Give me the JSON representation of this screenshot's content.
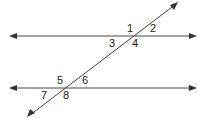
{
  "diagram": {
    "type": "parallel-lines-cut-by-transversal",
    "lines": [
      {
        "name": "top-parallel-line",
        "y": 36
      },
      {
        "name": "bottom-parallel-line",
        "y": 88
      }
    ],
    "transversal": {
      "from": [
        28,
        117
      ],
      "to": [
        178,
        3
      ]
    },
    "angle_labels": {
      "a1": "1",
      "a2": "2",
      "a3": "3",
      "a4": "4",
      "a5": "5",
      "a6": "6",
      "a7": "7",
      "a8": "8"
    },
    "colors": {
      "line": "#444444",
      "text": "#1a1a1a",
      "background": "#ffffff"
    }
  }
}
